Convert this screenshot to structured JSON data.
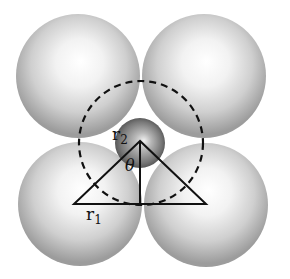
{
  "diagram": {
    "large_spheres": [
      {
        "id": "top-left",
        "cx": 78,
        "cy": 76,
        "r": 62
      },
      {
        "id": "top-right",
        "cx": 204,
        "cy": 76,
        "r": 62
      },
      {
        "id": "bottom-left",
        "cx": 80,
        "cy": 204,
        "r": 62
      },
      {
        "id": "bottom-right",
        "cx": 206,
        "cy": 205,
        "r": 62
      }
    ],
    "small_sphere": {
      "cx": 140,
      "cy": 143,
      "r": 25
    },
    "dashed_circle": {
      "cx": 141,
      "cy": 143,
      "r": 62
    },
    "triangle": {
      "apex": [
        140,
        141
      ],
      "base_left": [
        74,
        204
      ],
      "base_right": [
        206,
        204
      ],
      "altitude_foot": [
        140,
        204
      ]
    },
    "labels": {
      "r2": {
        "text": "r",
        "sub": "2"
      },
      "theta": {
        "text": "θ"
      },
      "r1": {
        "text": "r",
        "sub": "1"
      }
    },
    "colors": {
      "sphere_light": "#ffffff",
      "sphere_mid": "#d6d6d6",
      "sphere_edge": "#9a9a9a",
      "small_sphere_dark": "#555555",
      "line": "#111111"
    }
  }
}
